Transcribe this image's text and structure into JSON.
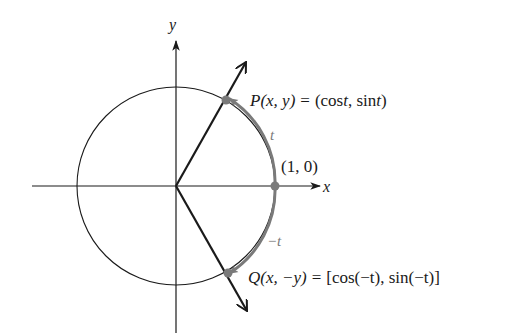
{
  "figure": {
    "axes": {
      "x_label": "x",
      "y_label": "y"
    },
    "points": {
      "P": {
        "name": "P",
        "args": "(x, y)",
        "equals": "=",
        "value_open": "(cos",
        "value_t1": "t",
        "value_mid": ", sin",
        "value_t2": "t",
        "value_close": ")"
      },
      "Q": {
        "name": "Q",
        "args": "(x, −y)",
        "equals": "=",
        "value": "[cos(−t), sin(−t)]"
      },
      "start": {
        "label": "(1, 0)"
      }
    },
    "arc_labels": {
      "positive": "t",
      "negative": "−t"
    },
    "colors": {
      "ink": "#1a1a1a",
      "arc": "#7a7a7a",
      "point": "#7a7a7a",
      "background": "#ffffff"
    }
  }
}
